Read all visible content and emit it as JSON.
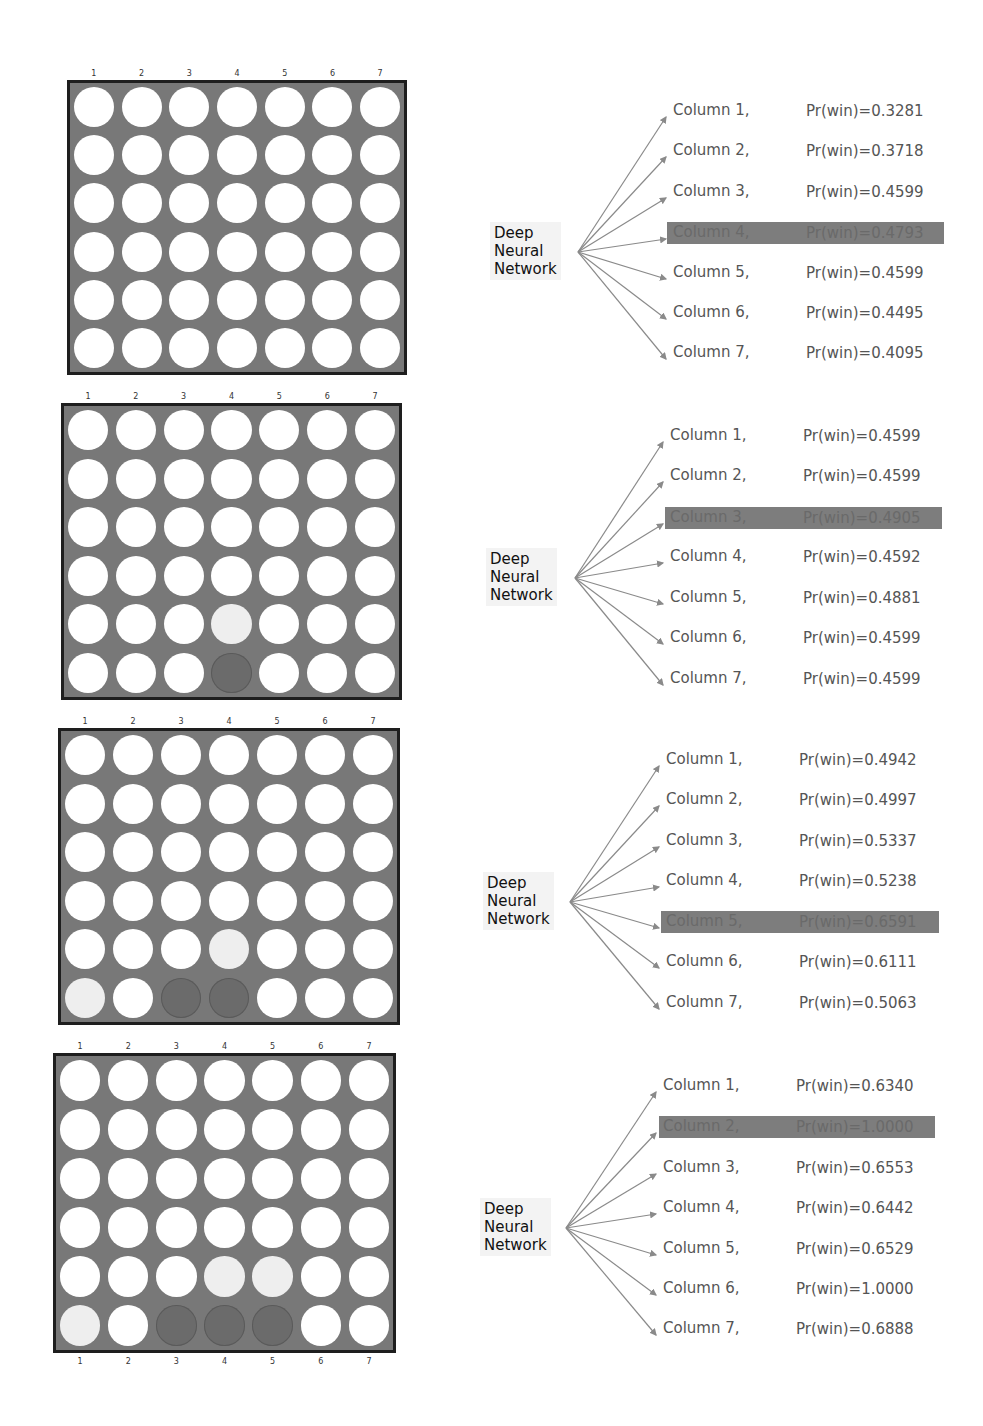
{
  "figure": {
    "model_label": "Deep Neural Network",
    "model_label_lines": [
      "Deep",
      "Neural",
      "Network"
    ],
    "column_numbers": [
      "1",
      "2",
      "3",
      "4",
      "5",
      "6",
      "7"
    ],
    "colors": {
      "board": "#787878",
      "board_border": "#1e1e1e",
      "empty_hole": "#ffffff",
      "dark_piece": "#6b6b6b",
      "light_piece": "#eeeeee",
      "highlight_bar": "#7d7d7d",
      "arrow": "#8a8a8a",
      "text": "#555555"
    },
    "panels": [
      {
        "board": {
          "x": 67,
          "y": 80,
          "w": 340,
          "h": 295,
          "bottom_labels": false,
          "pieces": []
        },
        "fan_origin": [
          578,
          252
        ],
        "label_box": {
          "x": 490,
          "y": 222
        },
        "text_x": 673,
        "value_x": 806,
        "bar_x": 667,
        "bar_w": 277,
        "rows_y": [
          111,
          151,
          192,
          233,
          273,
          313,
          353
        ],
        "highlight_index": 3,
        "evaluations": [
          {
            "label": "Column 1,",
            "value": "Pr(win)=0.3281"
          },
          {
            "label": "Column 2,",
            "value": "Pr(win)=0.3718"
          },
          {
            "label": "Column 3,",
            "value": "Pr(win)=0.4599"
          },
          {
            "label": "Column 4,",
            "value": "Pr(win)=0.4793"
          },
          {
            "label": "Column 5,",
            "value": "Pr(win)=0.4599"
          },
          {
            "label": "Column 6,",
            "value": "Pr(win)=0.4495"
          },
          {
            "label": "Column 7,",
            "value": "Pr(win)=0.4095"
          }
        ]
      },
      {
        "board": {
          "x": 61,
          "y": 403,
          "w": 341,
          "h": 297,
          "bottom_labels": false,
          "pieces": [
            {
              "row": 5,
              "col": 3,
              "player": "dark"
            },
            {
              "row": 4,
              "col": 3,
              "player": "light"
            }
          ]
        },
        "fan_origin": [
          575,
          578
        ],
        "label_box": {
          "x": 486,
          "y": 548
        },
        "text_x": 670,
        "value_x": 803,
        "bar_x": 665,
        "bar_w": 277,
        "rows_y": [
          436,
          476,
          518,
          557,
          598,
          638,
          679
        ],
        "highlight_index": 2,
        "evaluations": [
          {
            "label": "Column 1,",
            "value": "Pr(win)=0.4599"
          },
          {
            "label": "Column 2,",
            "value": "Pr(win)=0.4599"
          },
          {
            "label": "Column 3,",
            "value": "Pr(win)=0.4905"
          },
          {
            "label": "Column 4,",
            "value": "Pr(win)=0.4592"
          },
          {
            "label": "Column 5,",
            "value": "Pr(win)=0.4881"
          },
          {
            "label": "Column 6,",
            "value": "Pr(win)=0.4599"
          },
          {
            "label": "Column 7,",
            "value": "Pr(win)=0.4599"
          }
        ]
      },
      {
        "board": {
          "x": 58,
          "y": 728,
          "w": 342,
          "h": 297,
          "bottom_labels": false,
          "pieces": [
            {
              "row": 5,
              "col": 3,
              "player": "dark"
            },
            {
              "row": 4,
              "col": 3,
              "player": "light"
            },
            {
              "row": 5,
              "col": 2,
              "player": "dark"
            },
            {
              "row": 5,
              "col": 0,
              "player": "light"
            }
          ]
        },
        "fan_origin": [
          570,
          902
        ],
        "label_box": {
          "x": 483,
          "y": 872
        },
        "text_x": 666,
        "value_x": 799,
        "bar_x": 661,
        "bar_w": 278,
        "rows_y": [
          760,
          800,
          841,
          881,
          922,
          962,
          1003
        ],
        "highlight_index": 4,
        "evaluations": [
          {
            "label": "Column 1,",
            "value": "Pr(win)=0.4942"
          },
          {
            "label": "Column 2,",
            "value": "Pr(win)=0.4997"
          },
          {
            "label": "Column 3,",
            "value": "Pr(win)=0.5337"
          },
          {
            "label": "Column 4,",
            "value": "Pr(win)=0.5238"
          },
          {
            "label": "Column 5,",
            "value": "Pr(win)=0.6591"
          },
          {
            "label": "Column 6,",
            "value": "Pr(win)=0.6111"
          },
          {
            "label": "Column 7,",
            "value": "Pr(win)=0.5063"
          }
        ]
      },
      {
        "board": {
          "x": 53,
          "y": 1053,
          "w": 343,
          "h": 300,
          "bottom_labels": true,
          "pieces": [
            {
              "row": 5,
              "col": 3,
              "player": "dark"
            },
            {
              "row": 4,
              "col": 3,
              "player": "light"
            },
            {
              "row": 5,
              "col": 2,
              "player": "dark"
            },
            {
              "row": 5,
              "col": 0,
              "player": "light"
            },
            {
              "row": 5,
              "col": 4,
              "player": "dark"
            },
            {
              "row": 4,
              "col": 4,
              "player": "light"
            }
          ]
        },
        "fan_origin": [
          566,
          1228
        ],
        "label_box": {
          "x": 480,
          "y": 1198
        },
        "text_x": 663,
        "value_x": 796,
        "bar_x": 659,
        "bar_w": 276,
        "rows_y": [
          1086,
          1127,
          1168,
          1208,
          1249,
          1289,
          1329
        ],
        "highlight_index": 1,
        "evaluations": [
          {
            "label": "Column 1,",
            "value": "Pr(win)=0.6340"
          },
          {
            "label": "Column 2,",
            "value": "Pr(win)=1.0000"
          },
          {
            "label": "Column 3,",
            "value": "Pr(win)=0.6553"
          },
          {
            "label": "Column 4,",
            "value": "Pr(win)=0.6442"
          },
          {
            "label": "Column 5,",
            "value": "Pr(win)=0.6529"
          },
          {
            "label": "Column 6,",
            "value": "Pr(win)=1.0000"
          },
          {
            "label": "Column 7,",
            "value": "Pr(win)=0.6888"
          }
        ]
      }
    ]
  }
}
